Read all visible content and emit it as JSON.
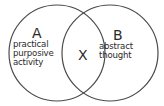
{
  "diagram": {
    "type": "venn",
    "colors": {
      "stroke": "#4a4a4a",
      "text": "#2a2a2a",
      "background": "#ffffff"
    },
    "sets": [
      {
        "id": "A",
        "label": "A",
        "description_lines": [
          "practical",
          "purposive",
          "activity"
        ]
      },
      {
        "id": "B",
        "label": "B",
        "description_lines": [
          "abstract",
          "thought"
        ]
      }
    ],
    "intersection": {
      "label": "X"
    }
  }
}
